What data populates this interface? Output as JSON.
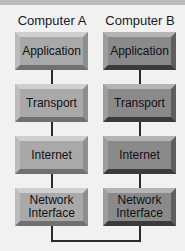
{
  "diagram": {
    "columns": [
      {
        "title": "Computer A",
        "layers": [
          "Application",
          "Transport",
          "Internet",
          "Network\nInterface"
        ]
      },
      {
        "title": "Computer B",
        "layers": [
          "Application",
          "Transport",
          "Internet",
          "Network\nInterface"
        ]
      }
    ],
    "colors": {
      "background": "#f1f1f1",
      "computer_a_box": "#a9a9a9",
      "computer_b_box": "#8a8a8a",
      "connector": "#2a2a2a"
    }
  }
}
